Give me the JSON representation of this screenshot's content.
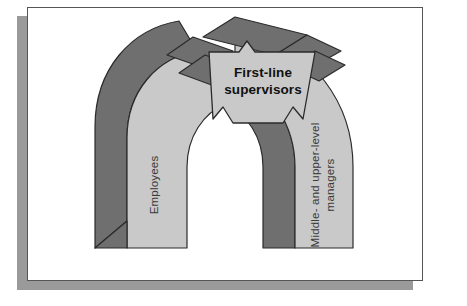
{
  "diagram": {
    "banner": {
      "line1": "First-line",
      "line2": "supervisors"
    },
    "left_pillar": {
      "label": "Employees"
    },
    "right_pillar": {
      "line1": "Middle- and upper-level",
      "line2": "managers"
    },
    "colors": {
      "face_light": "#c9c9c9",
      "face_dark": "#6f6f6f",
      "banner_face": "#c9c9c9",
      "banner_tail": "#6f6f6f",
      "outline": "#2b2b2b",
      "card_border": "#555555",
      "card_shadow": "#9a9a9a",
      "page_background": "#ffffff"
    }
  }
}
